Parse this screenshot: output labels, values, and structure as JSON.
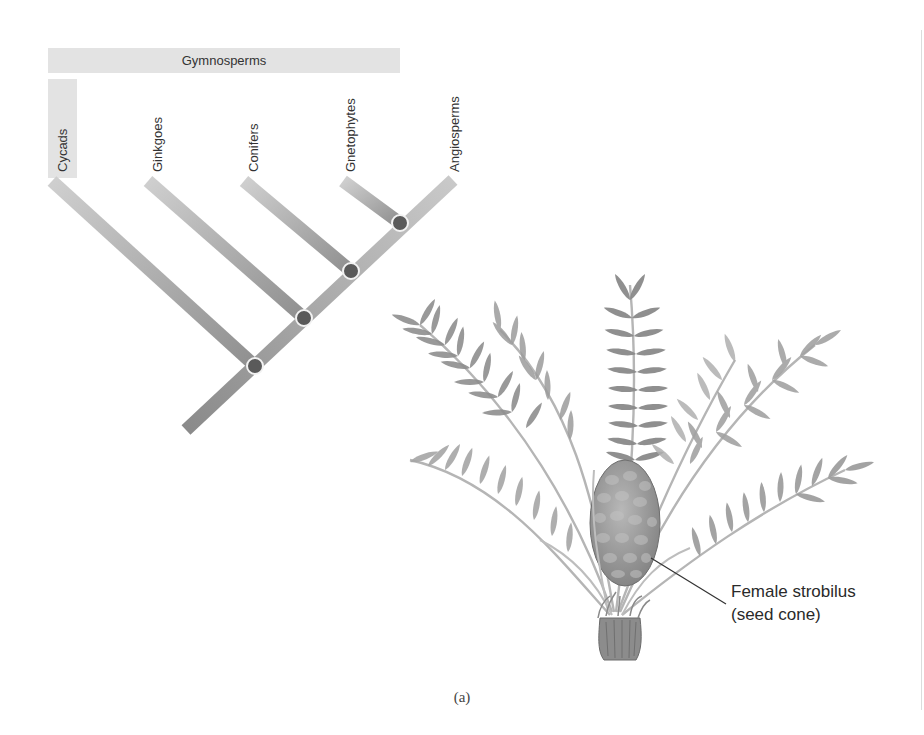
{
  "figure": {
    "caption": "(a)",
    "cladogram": {
      "group_label": "Gymnosperms",
      "taxa": [
        {
          "name": "Cycads",
          "group": "Gymnosperms"
        },
        {
          "name": "Ginkgoes",
          "group": "Gymnosperms"
        },
        {
          "name": "Conifers",
          "group": "Gymnosperms"
        },
        {
          "name": "Gnetophytes",
          "group": "Gymnosperms"
        },
        {
          "name": "Angiosperms",
          "group": null
        }
      ],
      "node_count": 4,
      "colors": {
        "branch": "#9a9a9a",
        "branch_light": "#c4c4c4",
        "node": "#5a5a5a",
        "node_ring": "#f2f2f2",
        "group_bar": "#e3e3e3"
      }
    },
    "illustration": {
      "subject": "Cycad plant",
      "callout": {
        "line1": "Female strobilus",
        "line2": "(seed cone)"
      }
    }
  }
}
